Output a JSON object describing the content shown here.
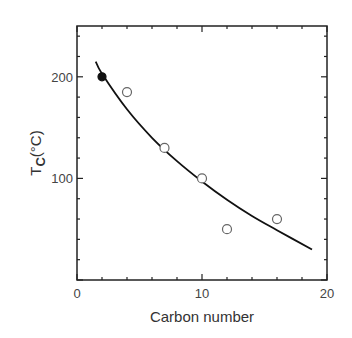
{
  "chart_data": {
    "type": "scatter",
    "title": "",
    "xlabel": "Carbon number",
    "ylabel": "T_C(°C)",
    "ylabel_parts": {
      "main": "T",
      "sub": "C",
      "unit": "(°C)"
    },
    "xlim": [
      0,
      20
    ],
    "ylim": [
      0,
      250
    ],
    "x_ticks_major": [
      0,
      10,
      20
    ],
    "x_tick_labels": [
      "0",
      "10",
      "20"
    ],
    "x_ticks_minor_step": 2,
    "y_ticks_major": [
      0,
      100,
      200
    ],
    "y_tick_labels": [
      "0",
      "100",
      "200"
    ],
    "y_ticks_minor_step": 20,
    "grid": false,
    "legend": null,
    "series": [
      {
        "name": "filled point",
        "marker": "filled-circle",
        "points": [
          [
            2,
            200
          ]
        ]
      },
      {
        "name": "open points",
        "marker": "open-circle",
        "points": [
          [
            4,
            185
          ],
          [
            7,
            130
          ],
          [
            10,
            100
          ],
          [
            12,
            50
          ],
          [
            16,
            60
          ]
        ]
      },
      {
        "name": "fit curve",
        "type": "line",
        "points": [
          [
            1.5,
            215
          ],
          [
            2,
            203
          ],
          [
            4,
            168
          ],
          [
            6,
            140
          ],
          [
            8,
            117
          ],
          [
            10,
            97
          ],
          [
            12,
            79
          ],
          [
            14,
            63
          ],
          [
            16,
            49
          ],
          [
            18.8,
            30
          ]
        ]
      }
    ]
  },
  "colors": {
    "line": "#111111",
    "axis": "#222222",
    "text": "#444444"
  }
}
